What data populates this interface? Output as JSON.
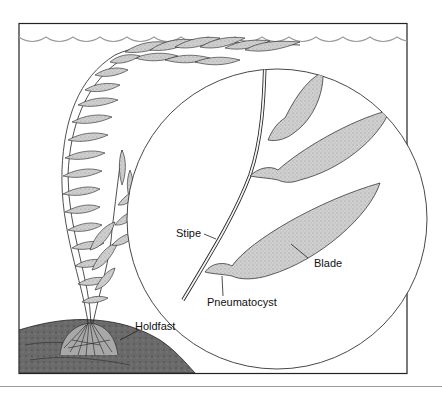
{
  "figure": {
    "labels": {
      "stipe": "Stipe",
      "blade": "Blade",
      "pneumatocyst": "Pneumatocyst",
      "holdfast": "Holdfast"
    },
    "colors": {
      "frame": "#222222",
      "water_surface": "#9a9a9a",
      "blade_fill": "#c9c9c9",
      "rock_fill": "#6e6e6e",
      "background": "#ffffff"
    }
  }
}
